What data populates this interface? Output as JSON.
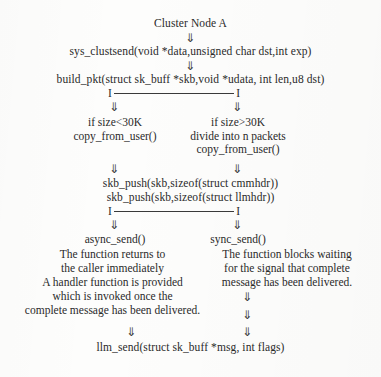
{
  "figure": {
    "title": "Cluster Node A",
    "arrow_glyph": "⇓",
    "bracket_end_glyph": "I",
    "colors": {
      "ink": "#2a2a2a",
      "line": "#3a3a3a",
      "paper": "#fdfdfc"
    }
  },
  "trunk": {
    "step1": "sys_clustsend(void *data,unsigned char dst,int exp)",
    "step2": "build_pkt(struct sk_buff *skb,void *udata, int len,u8 dst)",
    "merge1": "skb_push(skb,sizeof(struct cmmhdr))",
    "merge2": "skb_push(skb,sizeof(struct llmhdr))",
    "final": "llm_send(struct sk_buff *msg, int flags)"
  },
  "branch_small": {
    "condition": "if size<30K",
    "action": "copy_from_user()",
    "send_call": "async_send()",
    "description": [
      "The function returns to",
      "the caller immediately",
      "A handler function is provided",
      "which is invoked once the",
      "complete message has been delivered."
    ]
  },
  "branch_large": {
    "condition": "if size>30K",
    "action1": "divide into n packets",
    "action2": "copy_from_user()",
    "send_call": "sync_send()",
    "description": [
      "The function blocks waiting",
      "for the signal that complete",
      "message has been delivered."
    ]
  }
}
